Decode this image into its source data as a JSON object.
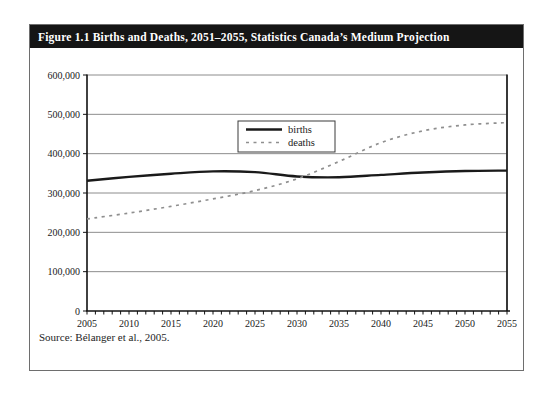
{
  "figure": {
    "title": "Figure 1.1 Births and Deaths, 2051–2055, Statistics Canada’s Medium Projection",
    "source": "Source: Bélanger et al., 2005."
  },
  "chart_data": {
    "type": "line",
    "x": [
      2005,
      2010,
      2015,
      2020,
      2025,
      2030,
      2035,
      2040,
      2045,
      2050,
      2055
    ],
    "x_tick_labels": [
      "2005",
      "2010",
      "2015",
      "2020",
      "2025",
      "2030",
      "2035",
      "2040",
      "2045",
      "2050",
      "2055"
    ],
    "x_minor_tick_every_years": 1,
    "xlim": [
      2005,
      2055
    ],
    "ylim": [
      0,
      600000
    ],
    "ytick_step": 100000,
    "y_tick_labels": [
      "0",
      "100,000",
      "200,000",
      "300,000",
      "400,000",
      "500,000",
      "600,000"
    ],
    "grid": "horizontal",
    "legend_position": "upper-center-inside",
    "title": "",
    "xlabel": "",
    "ylabel": "",
    "series": [
      {
        "name": "births",
        "style": "solid",
        "color": "#1a1a1a",
        "values": [
          331000,
          341000,
          349000,
          355000,
          353000,
          342000,
          340000,
          346000,
          352000,
          356000,
          357000
        ]
      },
      {
        "name": "deaths",
        "style": "dashed",
        "color": "#8f8f8f",
        "values": [
          234000,
          249000,
          266000,
          285000,
          306000,
          336000,
          380000,
          428000,
          458000,
          473000,
          479000
        ]
      }
    ],
    "colors": {
      "axis": "#111111",
      "gridline": "#6f6f6f",
      "plot_right_border": "#222222",
      "legend_border": "#3a3a3a"
    }
  }
}
